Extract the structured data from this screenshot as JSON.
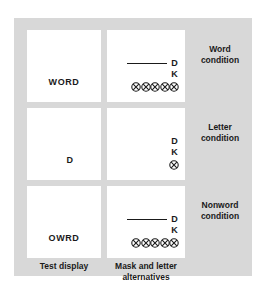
{
  "figure": {
    "background_color": "#d8d8d8",
    "card_color": "#ffffff",
    "ink_color": "#1a1a1a"
  },
  "columns": {
    "test_display_caption": "Test display",
    "mask_caption_line1": "Mask and letter",
    "mask_caption_line2": "alternatives"
  },
  "rows": [
    {
      "condition_label_line1": "Word",
      "condition_label_line2": "condition",
      "test_display": "WORD",
      "test_display_kind": "string",
      "mask": {
        "has_rule": true,
        "alternative_1": "D",
        "alternative_2": "K",
        "mask_glyph": "circled-x",
        "mask_glyph_count": 5
      }
    },
    {
      "condition_label_line1": "Letter",
      "condition_label_line2": "condition",
      "test_display": "D",
      "test_display_kind": "single",
      "mask": {
        "has_rule": false,
        "alternative_1": "D",
        "alternative_2": "K",
        "mask_glyph": "circled-x",
        "mask_glyph_count": 1
      }
    },
    {
      "condition_label_line1": "Nonword",
      "condition_label_line2": "condition",
      "test_display": "OWRD",
      "test_display_kind": "string",
      "mask": {
        "has_rule": true,
        "alternative_1": "D",
        "alternative_2": "K",
        "mask_glyph": "circled-x",
        "mask_glyph_count": 5
      }
    }
  ]
}
